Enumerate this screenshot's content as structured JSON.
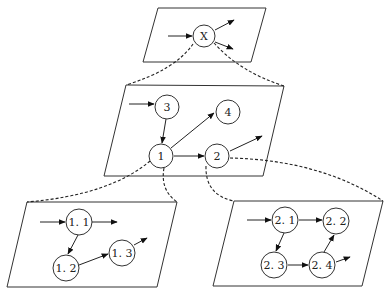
{
  "diagram": {
    "type": "hierarchical-decomposition",
    "panels": [
      {
        "id": "top",
        "nodes": [
          {
            "id": "X",
            "label": "X"
          }
        ]
      },
      {
        "id": "middle",
        "nodes": [
          {
            "id": "3",
            "label": "3"
          },
          {
            "id": "4",
            "label": "4"
          },
          {
            "id": "1",
            "label": "1"
          },
          {
            "id": "2",
            "label": "2"
          }
        ]
      },
      {
        "id": "bottom-left",
        "nodes": [
          {
            "id": "1.1",
            "label": "1. 1"
          },
          {
            "id": "1.2",
            "label": "1. 2"
          },
          {
            "id": "1.3",
            "label": "1. 3"
          }
        ]
      },
      {
        "id": "bottom-right",
        "nodes": [
          {
            "id": "2.1",
            "label": "2. 1"
          },
          {
            "id": "2.2",
            "label": "2. 2"
          },
          {
            "id": "2.3",
            "label": "2. 3"
          },
          {
            "id": "2.4",
            "label": "2. 4"
          }
        ]
      }
    ],
    "edges": [
      {
        "from": "in",
        "to": "X"
      },
      {
        "from": "X",
        "to": "out"
      },
      {
        "from": "X",
        "to": "out"
      },
      {
        "from": "in",
        "to": "3"
      },
      {
        "from": "3",
        "to": "1"
      },
      {
        "from": "1",
        "to": "4"
      },
      {
        "from": "1",
        "to": "2"
      },
      {
        "from": "2",
        "to": "out"
      },
      {
        "from": "in",
        "to": "1.1"
      },
      {
        "from": "1.1",
        "to": "out"
      },
      {
        "from": "1.1",
        "to": "1.2"
      },
      {
        "from": "1.2",
        "to": "1.3"
      },
      {
        "from": "1.3",
        "to": "out"
      },
      {
        "from": "in",
        "to": "2.1"
      },
      {
        "from": "2.1",
        "to": "2.2"
      },
      {
        "from": "2.1",
        "to": "2.3"
      },
      {
        "from": "2.3",
        "to": "2.4"
      },
      {
        "from": "2.4",
        "to": "2.2"
      },
      {
        "from": "2.4",
        "to": "out"
      }
    ],
    "expansions": [
      {
        "node": "X",
        "expands_to": "middle"
      },
      {
        "node": "1",
        "expands_to": "bottom-left"
      },
      {
        "node": "2",
        "expands_to": "bottom-right"
      }
    ]
  }
}
